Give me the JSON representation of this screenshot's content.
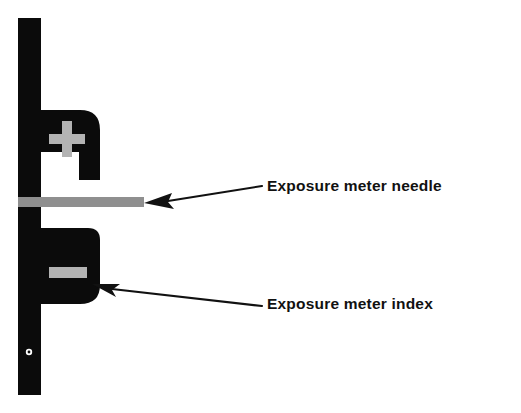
{
  "figure": {
    "background_color": "#ffffff",
    "body_color": "#0b0b0b",
    "marker_color": "#b3b3b3",
    "leader_color": "#111111",
    "parts": {
      "plus_symbol": "+",
      "minus_symbol": "–",
      "needle_name": "needle-bar",
      "index_name": "index-bar",
      "pivot_hole_name": "pivot-hole"
    }
  },
  "callouts": [
    {
      "id": "needle",
      "label": "Exposure meter needle",
      "arrow_tip": {
        "x": 144,
        "y": 203
      },
      "leader_end": {
        "x": 262,
        "y": 186
      }
    },
    {
      "id": "index",
      "label": "Exposure meter index",
      "arrow_tip": {
        "x": 92,
        "y": 284
      },
      "leader_end": {
        "x": 262,
        "y": 306
      }
    }
  ]
}
